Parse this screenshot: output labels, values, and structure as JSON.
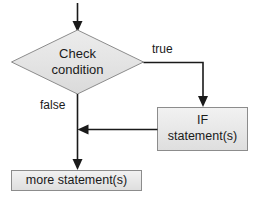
{
  "diagram": {
    "type": "flowchart",
    "background_color": "#ffffff",
    "shape_fill_color": "#e6e6e6",
    "shape_fill_color_light": "#f0f0f0",
    "shape_stroke_color": "#8c8c8c",
    "line_color": "#1a1a1a",
    "text_color": "#1a1a1a",
    "nodes": [
      {
        "id": "check-condition",
        "shape": "diamond",
        "label_line1": "Check",
        "label_line2": "condition",
        "cx": 77.5,
        "cy": 62,
        "half_width": 66,
        "half_height": 32
      },
      {
        "id": "if-statements",
        "shape": "rectangle",
        "label_line1": "IF",
        "label_line2": "statement(s)",
        "x": 157,
        "y": 107,
        "width": 91,
        "height": 44
      },
      {
        "id": "more-statements",
        "shape": "rectangle",
        "label_line1": "more statement(s)",
        "label_line2": "",
        "x": 11,
        "y": 170,
        "width": 131,
        "height": 21
      }
    ],
    "edges": [
      {
        "id": "entry-edge",
        "label": "",
        "from": "entry",
        "to": "check-condition"
      },
      {
        "id": "true-edge",
        "label": "true",
        "label_x": 152,
        "label_y": 53,
        "from": "check-condition",
        "to": "if-statements"
      },
      {
        "id": "false-edge",
        "label": "false",
        "label_x": 40,
        "label_y": 109,
        "from": "check-condition",
        "to": "more-statements"
      },
      {
        "id": "merge-edge",
        "label": "",
        "from": "if-statements",
        "to": "false-edge"
      }
    ]
  }
}
